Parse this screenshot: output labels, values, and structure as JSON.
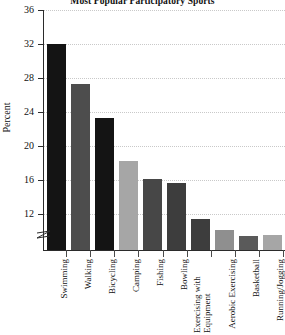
{
  "chart_data": {
    "type": "bar",
    "title": "Most Popular Participatory Sports",
    "xlabel": "",
    "ylabel": "Percent",
    "ylim": [
      8,
      36
    ],
    "yticks": [
      12,
      16,
      20,
      24,
      28,
      32,
      36
    ],
    "grid": true,
    "legend": "none",
    "axis_break": true,
    "categories": [
      "Swimming",
      "Walking",
      "Bicycling",
      "Camping",
      "Fishing",
      "Bowling",
      "Exercising with Equipment",
      "Aerobic Exercising",
      "Basketball",
      "Running/Jogging"
    ],
    "values": [
      32.0,
      27.3,
      23.3,
      18.2,
      16.1,
      15.6,
      11.4,
      10.1,
      9.4,
      9.5
    ],
    "bar_colors": [
      "#141414",
      "#4d4d4d",
      "#141414",
      "#a6a6a6",
      "#474747",
      "#3d3d3d",
      "#3d3d3d",
      "#8f8f8f",
      "#5a5a5a",
      "#a6a6a6"
    ]
  },
  "axis": {
    "y_title": "Percent",
    "tick_labels": [
      "36",
      "32",
      "28",
      "24",
      "20",
      "16",
      "12"
    ]
  }
}
